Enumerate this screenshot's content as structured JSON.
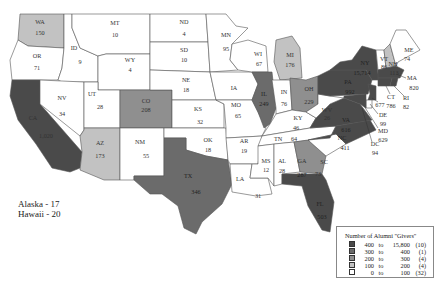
{
  "colors": {
    "c400": "#4a4a4a",
    "c300": "#6b6b6b",
    "c200": "#8f8f8f",
    "c100": "#c2c2c2",
    "c0": "#ffffff"
  },
  "notes": {
    "alaska": "Alaska - 17",
    "hawaii": "Hawaii - 20"
  },
  "legend": {
    "title": "Number of Alumni \"Givers\"",
    "rows": [
      {
        "lo": "400",
        "to": "to",
        "hi": "15,800",
        "count": "(10)"
      },
      {
        "lo": "300",
        "to": "to",
        "hi": "400",
        "count": "(1)"
      },
      {
        "lo": "200",
        "to": "to",
        "hi": "300",
        "count": "(4)"
      },
      {
        "lo": "100",
        "to": "to",
        "hi": "200",
        "count": "(4)"
      },
      {
        "lo": "0",
        "to": "to",
        "hi": "100",
        "count": "(32)"
      }
    ]
  },
  "states": {
    "WA": {
      "abbr": "WA",
      "value": "150"
    },
    "OR": {
      "abbr": "OR",
      "value": "71"
    },
    "CA": {
      "abbr": "CA",
      "value": "1,020"
    },
    "ID": {
      "abbr": "ID",
      "value": "9"
    },
    "NV": {
      "abbr": "NV",
      "value": "34"
    },
    "MT": {
      "abbr": "MT",
      "value": "10"
    },
    "WY": {
      "abbr": "WY",
      "value": "4"
    },
    "UT": {
      "abbr": "UT",
      "value": "28"
    },
    "AZ": {
      "abbr": "AZ",
      "value": "173"
    },
    "CO": {
      "abbr": "CO",
      "value": "208"
    },
    "NM": {
      "abbr": "NM",
      "value": "55"
    },
    "ND": {
      "abbr": "ND",
      "value": "4"
    },
    "SD": {
      "abbr": "SD",
      "value": "10"
    },
    "NE": {
      "abbr": "NE",
      "value": "18"
    },
    "KS": {
      "abbr": "KS",
      "value": "32"
    },
    "OK": {
      "abbr": "OK",
      "value": "18"
    },
    "TX": {
      "abbr": "TX",
      "value": "346"
    },
    "MN": {
      "abbr": "MN",
      "value": "95"
    },
    "IA": {
      "abbr": "IA",
      "value": "67"
    },
    "MO": {
      "abbr": "MO",
      "value": "65"
    },
    "AR": {
      "abbr": "AR",
      "value": "19"
    },
    "LA": {
      "abbr": "LA",
      "value": "31"
    },
    "WI": {
      "abbr": "WI",
      "value": "67"
    },
    "IL": {
      "abbr": "IL",
      "value": "249"
    },
    "MI": {
      "abbr": "MI",
      "value": "176"
    },
    "IN": {
      "abbr": "IN",
      "value": "76"
    },
    "OH": {
      "abbr": "OH",
      "value": "229"
    },
    "KY": {
      "abbr": "KY",
      "value": "46"
    },
    "TN": {
      "abbr": "TN",
      "value": "64"
    },
    "MS": {
      "abbr": "MS",
      "value": "12"
    },
    "AL": {
      "abbr": "AL",
      "value": "28"
    },
    "GA": {
      "abbr": "GA",
      "value": "287"
    },
    "FL": {
      "abbr": "FL",
      "value": "503"
    },
    "SC": {
      "abbr": "SC",
      "value": "73"
    },
    "NC": {
      "abbr": "NC",
      "value": "411"
    },
    "VA": {
      "abbr": "VA",
      "value": "616"
    },
    "WV": {
      "abbr": "WV",
      "value": "26"
    },
    "PA": {
      "abbr": "PA",
      "value": "992"
    },
    "NY": {
      "abbr": "NY",
      "value": "15,714"
    },
    "VT": {
      "abbr": "VT",
      "value": "86"
    },
    "NH": {
      "abbr": "NH",
      "value": "113"
    },
    "ME": {
      "abbr": "ME",
      "value": "74"
    },
    "MA": {
      "abbr": "MA",
      "value": "820"
    },
    "RI": {
      "abbr": "RI",
      "value": "82"
    },
    "CT": {
      "abbr": "CT",
      "value": "786"
    },
    "NJ": {
      "abbr": "NJ",
      "value": "677"
    },
    "DE": {
      "abbr": "DE",
      "value": "99"
    },
    "MD": {
      "abbr": "MD",
      "value": "629"
    },
    "DC": {
      "abbr": "DC",
      "value": "94"
    }
  }
}
